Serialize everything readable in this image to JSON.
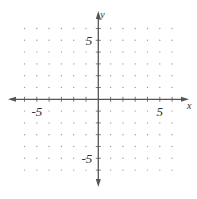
{
  "chart_data": {
    "type": "scatter",
    "title": "",
    "xlabel": "x",
    "ylabel": "y",
    "xlim": [
      -6,
      6
    ],
    "ylim": [
      -6,
      6
    ],
    "grid": "dots",
    "tick_step": 1,
    "tick_labels": {
      "x": [
        {
          "value": -5,
          "label": "-5"
        },
        {
          "value": 5,
          "label": "5"
        }
      ],
      "y": [
        {
          "value": 5,
          "label": "5"
        },
        {
          "value": -5,
          "label": "-5"
        }
      ]
    },
    "series": []
  },
  "layout": {
    "origin_px": [
      98.3,
      99.3
    ],
    "unit_x_px": 12.3,
    "unit_y_px": 11.8,
    "axis_color": "#555555",
    "dot_color": "#9a9a9a",
    "label_color": "#333333"
  }
}
